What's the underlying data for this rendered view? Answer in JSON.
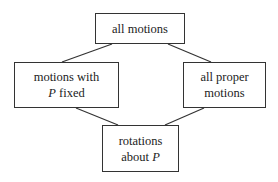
{
  "diagram": {
    "nodes": [
      {
        "id": "all-motions",
        "lines": [
          "all motions"
        ]
      },
      {
        "id": "motions-p-fixed",
        "line1": "motions with",
        "line2_var": "P",
        "line2_rest": " fixed"
      },
      {
        "id": "all-proper",
        "lines": [
          "all proper",
          "motions"
        ]
      },
      {
        "id": "rotations",
        "line1": "rotations",
        "line2_pre": "about ",
        "line2_var": "P"
      }
    ],
    "edges": [
      [
        "all-motions",
        "motions-p-fixed"
      ],
      [
        "all-motions",
        "all-proper"
      ],
      [
        "motions-p-fixed",
        "rotations"
      ],
      [
        "all-proper",
        "rotations"
      ]
    ]
  }
}
